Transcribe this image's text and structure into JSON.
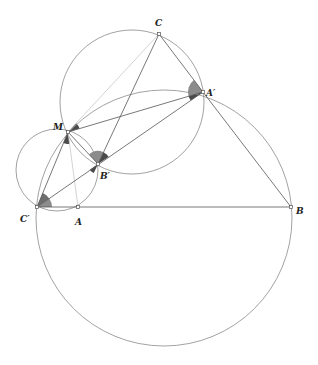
{
  "figure": {
    "type": "geometry-diagram",
    "points": {
      "A": {
        "label": "A",
        "x": 78,
        "y": 207
      },
      "B": {
        "label": "B",
        "x": 291,
        "y": 207
      },
      "C": {
        "label": "C",
        "x": 159,
        "y": 34
      },
      "A_prime": {
        "label": "A′",
        "x": 203,
        "y": 92
      },
      "B_prime": {
        "label": "B′",
        "x": 98,
        "y": 164
      },
      "C_prime": {
        "label": "C′",
        "x": 37,
        "y": 207
      },
      "M": {
        "label": "M",
        "x": 68,
        "y": 132
      }
    },
    "circles": [
      {
        "name": "big-circle",
        "through": [
          "C′",
          "B",
          "A′",
          "M"
        ],
        "cx": 164,
        "cy": 218,
        "r": 128
      },
      {
        "name": "upper-circle",
        "through": [
          "C",
          "A′",
          "B′",
          "M"
        ],
        "cx": 132,
        "cy": 102,
        "r": 72
      },
      {
        "name": "small-circle",
        "through": [
          "M",
          "C′",
          "A",
          "B′"
        ],
        "cx": 57,
        "cy": 170,
        "r": 41
      }
    ],
    "segments": [
      [
        "C′",
        "B"
      ],
      [
        "C",
        "A′"
      ],
      [
        "A′",
        "B"
      ],
      [
        "C",
        "B′"
      ],
      [
        "C′",
        "A′"
      ],
      [
        "M",
        "A′"
      ],
      [
        "M",
        "B′"
      ],
      [
        "C′",
        "M"
      ]
    ],
    "light_segments": [
      [
        "M",
        "C"
      ],
      [
        "M",
        "A"
      ]
    ],
    "angle_marks": [
      "C′ (two sectors)",
      "M (two sectors)",
      "B′ (three sectors)",
      "A′ (two sectors)"
    ],
    "colors": {
      "line": "#555555",
      "light_line": "#c8c8c8",
      "circle": "#8a8a8a",
      "sector_dark": "#4a4a4a",
      "sector_light": "#8c8c8c"
    }
  }
}
